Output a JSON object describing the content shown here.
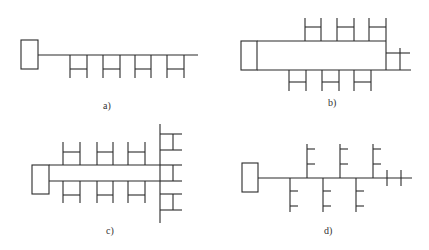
{
  "figure": {
    "panels": [
      {
        "id": "a",
        "label": "a)",
        "description": "Single main line with four ladder-shaped branches below"
      },
      {
        "id": "b",
        "label": "b)",
        "description": "Closed loop with three ladder branches above, three below, and one on the right end"
      },
      {
        "id": "c",
        "label": "c)",
        "description": "Double line with ladder branches on both sides, ending at a vertical trunk with six comb branches"
      },
      {
        "id": "d",
        "label": "d)",
        "description": "Single main line with alternating fishbone branches above and below, two crossing stubs at the end"
      }
    ],
    "colors": {
      "line": "#2a2a2a",
      "background": "#ffffff",
      "label": "#333333"
    }
  }
}
